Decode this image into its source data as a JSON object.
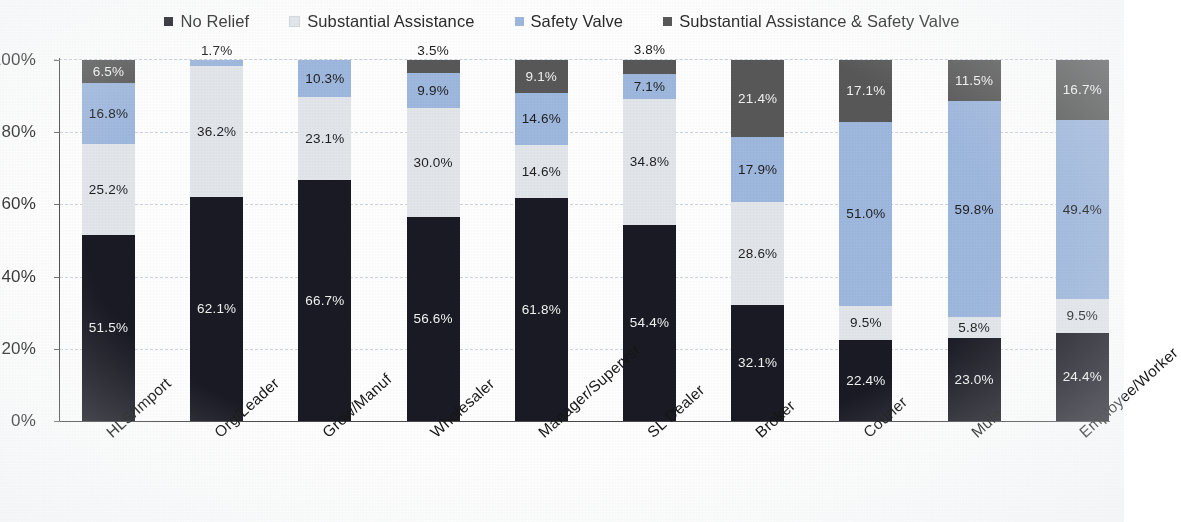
{
  "legend": {
    "position": "top-center",
    "items": [
      {
        "label": "No Relief",
        "color": "#1a1a24",
        "marker": "square-marker"
      },
      {
        "label": "Substantial Assistance",
        "color": "#e3e7ec",
        "marker": "square-marker"
      },
      {
        "label": "Safety Valve",
        "color": "#9fb8de",
        "marker": "square-marker"
      },
      {
        "label": "Substantial Assistance & Safety Valve",
        "color": "#585858",
        "marker": "square-marker"
      }
    ]
  },
  "yaxis": {
    "ticks": [
      "0%",
      "20%",
      "40%",
      "60%",
      "80%",
      "100%"
    ],
    "values": [
      0,
      20,
      40,
      60,
      80,
      100
    ],
    "min": 0,
    "max": 100
  },
  "chart_data": {
    "type": "bar",
    "subtype": "stacked-100-percent",
    "title": "",
    "subtitle": "",
    "xlabel": "",
    "ylabel": "",
    "ylim": [
      0,
      100
    ],
    "grid": true,
    "gridlines": [
      20,
      40,
      60,
      80
    ],
    "legend_position": "top-center",
    "value_format": "percent-one-decimal",
    "categories": [
      "HLS/Import",
      "Org/Leader",
      "Grow/Manuf",
      "Wholesaler",
      "Manager/Supervsr",
      "SL Dealer",
      "Broker",
      "Courier",
      "Mule",
      "Employee/Worker"
    ],
    "series": [
      {
        "name": "No Relief",
        "color": "#1a1a24",
        "values": [
          51.5,
          62.1,
          66.7,
          56.6,
          61.8,
          54.4,
          32.1,
          22.4,
          23.0,
          24.4
        ],
        "labels": [
          "51.5%",
          "62.1%",
          "66.7%",
          "56.6%",
          "61.8%",
          "54.4%",
          "32.1%",
          "22.4%",
          "23.0%",
          "24.4%"
        ]
      },
      {
        "name": "Substantial Assistance",
        "color": "#e3e7ec",
        "values": [
          25.2,
          36.2,
          23.1,
          30.0,
          14.6,
          34.8,
          28.6,
          9.5,
          5.8,
          9.5
        ],
        "labels": [
          "25.2%",
          "36.2%",
          "23.1%",
          "30.0%",
          "14.6%",
          "34.8%",
          "28.6%",
          "9.5%",
          "5.8%",
          "9.5%"
        ]
      },
      {
        "name": "Safety Valve",
        "color": "#9fb8de",
        "values": [
          16.8,
          1.7,
          10.3,
          9.9,
          14.6,
          7.1,
          17.9,
          51.0,
          59.8,
          49.4
        ],
        "labels": [
          "16.8%",
          "1.7%",
          "10.3%",
          "9.9%",
          "14.6%",
          "7.1%",
          "17.9%",
          "51.0%",
          "59.8%",
          "49.4%"
        ]
      },
      {
        "name": "Substantial Assistance & Safety Valve",
        "color": "#585858",
        "values": [
          6.5,
          0,
          0,
          3.5,
          9.1,
          3.8,
          21.4,
          17.1,
          11.5,
          16.7
        ],
        "labels": [
          "6.5%",
          "",
          "",
          "3.5%",
          "9.1%",
          "3.8%",
          "21.4%",
          "17.1%",
          "11.5%",
          "16.7%"
        ]
      }
    ]
  }
}
